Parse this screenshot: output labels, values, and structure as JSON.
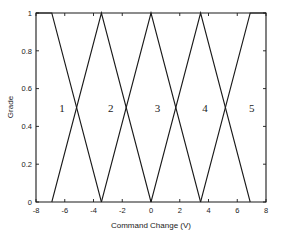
{
  "chart_data": {
    "type": "line",
    "title": "",
    "xlabel": "Command Change (V)",
    "ylabel": "Grade",
    "xlim": [
      -8,
      8
    ],
    "ylim": [
      0,
      1
    ],
    "grid": false,
    "legend": "none",
    "xticks": [
      -8,
      -6,
      -4,
      -2,
      0,
      2,
      4,
      6,
      8
    ],
    "xtick_labels": [
      "-8",
      "-6",
      "-4",
      "-2",
      "0",
      "2",
      "4",
      "6",
      "8"
    ],
    "yticks": [
      0,
      0.2,
      0.4,
      0.6,
      0.8,
      1
    ],
    "ytick_labels": [
      "0",
      "0.2",
      "0.4",
      "0.6",
      "0.8",
      "1"
    ],
    "annotations": [
      {
        "text": "1",
        "x": -6.2,
        "y": 0.5
      },
      {
        "text": "2",
        "x": -2.8,
        "y": 0.5
      },
      {
        "text": "3",
        "x": 0.45,
        "y": 0.5
      },
      {
        "text": "4",
        "x": 3.75,
        "y": 0.5
      },
      {
        "text": "5",
        "x": 7.0,
        "y": 0.5
      }
    ],
    "series": [
      {
        "name": "1",
        "x": [
          -8,
          -6.9,
          -3.45
        ],
        "values": [
          1,
          1,
          0
        ]
      },
      {
        "name": "2",
        "x": [
          -6.9,
          -3.45,
          0
        ],
        "values": [
          0,
          1,
          0
        ]
      },
      {
        "name": "3",
        "x": [
          -3.45,
          0,
          3.45
        ],
        "values": [
          0,
          1,
          0
        ]
      },
      {
        "name": "4",
        "x": [
          0,
          3.45,
          6.9
        ],
        "values": [
          0,
          1,
          0
        ]
      },
      {
        "name": "5",
        "x": [
          3.45,
          6.9,
          8
        ],
        "values": [
          0,
          1,
          1
        ]
      }
    ]
  },
  "figure": {
    "axis_color": "#1a1a1a",
    "line_color": "#1a1a1a",
    "background": "#ffffff"
  }
}
